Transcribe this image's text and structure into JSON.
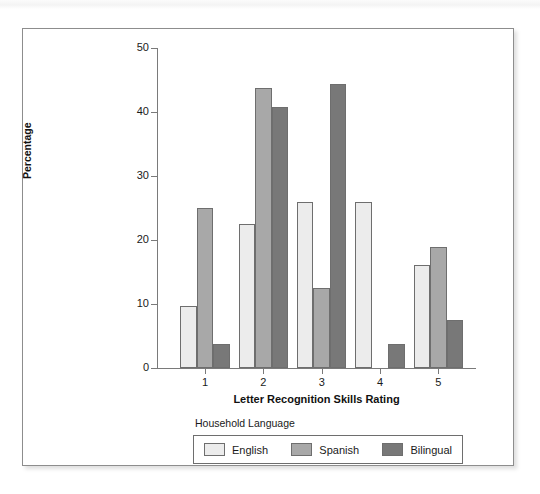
{
  "figure": {
    "background_color": "#ffffff",
    "frame_border_color": "#8d8d8d"
  },
  "chart_data": {
    "type": "bar",
    "title": "",
    "xlabel": "Letter Recognition Skills Rating",
    "ylabel": "Percentage",
    "categories": [
      "1",
      "2",
      "3",
      "4",
      "5"
    ],
    "ylim": [
      0,
      50
    ],
    "yticks": [
      0,
      10,
      20,
      30,
      40,
      50
    ],
    "grid": false,
    "legend_position": "bottom",
    "legend_title": "Household Language",
    "series": [
      {
        "name": "English",
        "color": "#ececec",
        "values": [
          9.7,
          22.5,
          26.0,
          26.0,
          16.1
        ]
      },
      {
        "name": "Spanish",
        "color": "#a8a8a8",
        "values": [
          25.0,
          43.7,
          12.5,
          0,
          18.9
        ]
      },
      {
        "name": "Bilingual",
        "color": "#787878",
        "values": [
          3.7,
          40.8,
          44.4,
          3.7,
          7.5
        ]
      }
    ]
  },
  "legend": {
    "title": "Household Language",
    "items": [
      {
        "label": "English"
      },
      {
        "label": "Spanish"
      },
      {
        "label": "Bilingual"
      }
    ]
  },
  "axes": {
    "y_title": "Percentage",
    "x_title": "Letter Recognition Skills Rating",
    "y_tick_labels": [
      "0",
      "10",
      "20",
      "30",
      "40",
      "50"
    ],
    "x_tick_labels": [
      "1",
      "2",
      "3",
      "4",
      "5"
    ]
  }
}
